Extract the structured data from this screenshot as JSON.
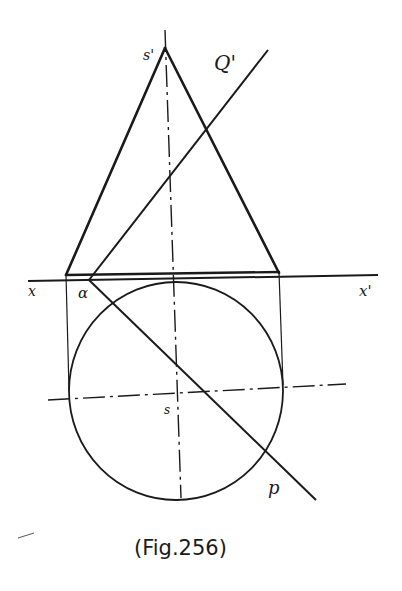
{
  "figure": {
    "caption": "(Fig.256)",
    "ink_color": "#1a1a1a",
    "background": "#ffffff"
  },
  "labels": {
    "apex_front": "s'",
    "plane_trace_vertical": "Q'",
    "ground_left": "x",
    "ground_right": "x'",
    "angle": "α",
    "apex_top": "s",
    "plane_trace_horizontal": "p"
  },
  "elements": {
    "elevation": "cone elevation (triangle)",
    "plan": "base circle",
    "reference_line": "x-x' ground line",
    "section_plane_vt": "Q'",
    "section_plane_ht": "p"
  }
}
